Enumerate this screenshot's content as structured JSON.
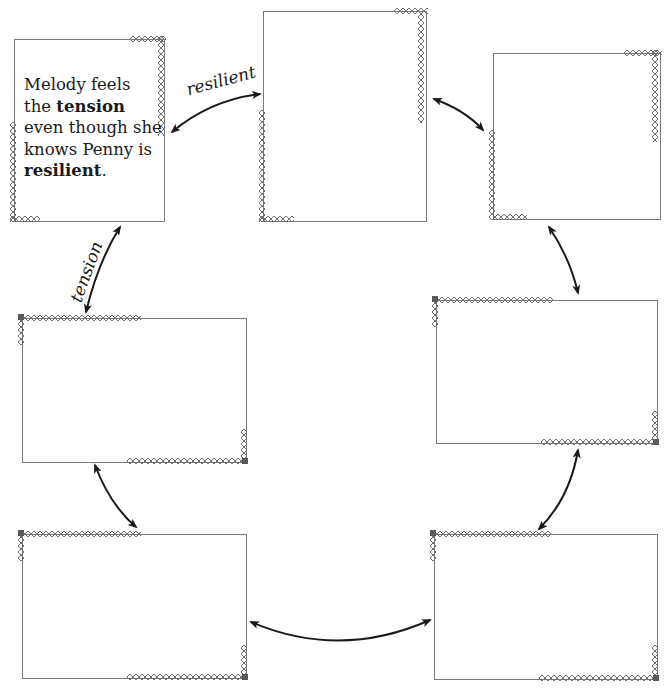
{
  "diagram": {
    "type": "cycle-of-boxes",
    "boxes": [
      {
        "id": 1,
        "position": "top-left",
        "text_parts": [
          {
            "text": "Melody feels",
            "bold": false
          },
          {
            "text": "the ",
            "bold": false
          },
          {
            "text": "tension",
            "bold": true
          },
          {
            "text": "even though she",
            "bold": false
          },
          {
            "text": "knows Penny is",
            "bold": false
          },
          {
            "text": "resilient",
            "bold": true
          },
          {
            "text": ".",
            "bold": false
          }
        ]
      },
      {
        "id": 2,
        "position": "top-center",
        "text": ""
      },
      {
        "id": 3,
        "position": "top-right",
        "text": ""
      },
      {
        "id": 4,
        "position": "middle-right",
        "text": ""
      },
      {
        "id": 5,
        "position": "bottom-right",
        "text": ""
      },
      {
        "id": 6,
        "position": "middle-left",
        "text": ""
      },
      {
        "id": 7,
        "position": "bottom-left",
        "text": ""
      }
    ],
    "arrow_labels": {
      "box1_box2": "resilient",
      "box1_box6": "tension"
    },
    "colors": {
      "frame": "#7a7a7a",
      "arrow": "#1a1a1a",
      "text": "#1a1a1a"
    }
  }
}
